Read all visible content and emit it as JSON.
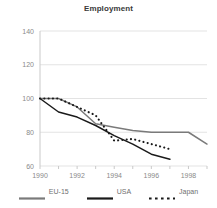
{
  "chart_data": {
    "type": "line",
    "title": "Employment",
    "xlabel": "",
    "ylabel": "",
    "x": [
      1990,
      1991,
      1992,
      1993,
      1994,
      1995,
      1996,
      1997,
      1998,
      1999
    ],
    "xlim": [
      1990,
      1999
    ],
    "ylim": [
      60,
      140
    ],
    "xticks": [
      1990,
      1992,
      1994,
      1996,
      1998
    ],
    "yticks": [
      60,
      80,
      100,
      120,
      140
    ],
    "xtick_labels": [
      "1990",
      "1992",
      "1994",
      "1996",
      "1998"
    ],
    "ytick_labels": [
      "60",
      "80",
      "100",
      "120",
      "140"
    ],
    "grid": "horizontal",
    "legend_position": "bottom",
    "series": [
      {
        "name": "EU-15",
        "color": "#7a7a7a",
        "style": "solid",
        "x": [
          1990,
          1991,
          1992,
          1993,
          1994,
          1995,
          1996,
          1997,
          1998,
          1999
        ],
        "values": [
          100,
          100,
          95,
          85,
          83,
          81,
          80,
          80,
          80,
          73
        ]
      },
      {
        "name": "USA",
        "color": "#1a1a1a",
        "style": "solid",
        "x": [
          1990,
          1991,
          1992,
          1993,
          1994,
          1995,
          1996,
          1997
        ],
        "values": [
          100,
          92,
          89,
          84,
          78,
          73,
          67,
          64
        ]
      },
      {
        "name": "Japan",
        "color": "#1a1a1a",
        "style": "dotted",
        "x": [
          1990,
          1991,
          1992,
          1993,
          1994,
          1995,
          1996,
          1997
        ],
        "values": [
          100,
          100,
          95,
          90,
          75,
          76,
          73,
          70
        ]
      }
    ]
  },
  "legend": {
    "items": [
      {
        "label": "EU-15"
      },
      {
        "label": "USA"
      },
      {
        "label": "Japan"
      }
    ]
  },
  "colors": {
    "eu": "#7a7a7a",
    "usa": "#1a1a1a",
    "japan": "#1a1a1a",
    "grid": "#e3e3e3",
    "axis": "#c9c9c9",
    "tick_text": "#8a8a8a",
    "title_text": "#3a3a3a"
  }
}
